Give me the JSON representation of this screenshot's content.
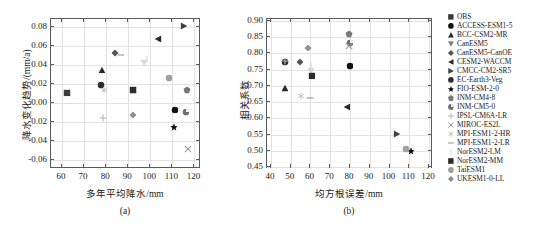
{
  "figure": {
    "panels": [
      {
        "id": "a",
        "caption": "(a)",
        "xlabel": "多年平均降水/mm",
        "ylabel": "降水变化趋势/(mm/a)",
        "xlim": [
          55,
          123
        ],
        "ylim": [
          -0.07,
          0.088
        ],
        "xticks": [
          60,
          70,
          80,
          90,
          100,
          110,
          120
        ],
        "xticklabels": [
          "60",
          "70",
          "80",
          "90",
          "100",
          "110",
          "120"
        ],
        "yticks": [
          -0.06,
          -0.04,
          -0.02,
          0.0,
          0.02,
          0.04,
          0.06,
          0.08
        ],
        "yticklabels": [
          "-0.06",
          "-0.04",
          "-0.02",
          "0.00",
          "0.02",
          "0.04",
          "0.06",
          "0.08"
        ]
      },
      {
        "id": "b",
        "caption": "(b)",
        "xlabel": "均方根误差/mm",
        "ylabel": "相关系数",
        "xlim": [
          38,
          122
        ],
        "ylim": [
          0.445,
          0.905
        ],
        "xticks": [
          40,
          50,
          60,
          70,
          80,
          90,
          100,
          110,
          120
        ],
        "xticklabels": [
          "40",
          "50",
          "60",
          "70",
          "80",
          "90",
          "100",
          "110",
          "120"
        ],
        "yticks": [
          0.45,
          0.5,
          0.55,
          0.6,
          0.65,
          0.7,
          0.75,
          0.8,
          0.85,
          0.9
        ],
        "yticklabels": [
          "0.45",
          "0.50",
          "0.55",
          "0.60",
          "0.65",
          "0.70",
          "0.75",
          "0.80",
          "0.85",
          "0.90"
        ]
      }
    ]
  },
  "legend": {
    "items": [
      {
        "label": "OBS",
        "marker": "square",
        "color": "#3c3c3c",
        "icon": "square-marker-icon"
      },
      {
        "label": "ACCESS-ESM1-5",
        "marker": "circle",
        "color": "#111111",
        "icon": "circle-marker-icon"
      },
      {
        "label": "BCC-CSM2-MR",
        "marker": "triangle-up",
        "color": "#2b2b2b",
        "icon": "triangle-up-marker-icon"
      },
      {
        "label": "CanESM5",
        "marker": "triangle-down",
        "color": "#808080",
        "icon": "triangle-down-marker-icon"
      },
      {
        "label": "CanESM5-CanOE",
        "marker": "diamond",
        "color": "#555555",
        "icon": "diamond-marker-icon"
      },
      {
        "label": "CESM2-WACCM",
        "marker": "triangle-left",
        "color": "#2b2b2b",
        "icon": "triangle-left-marker-icon"
      },
      {
        "label": "CMCC-CM2-SR5",
        "marker": "triangle-right",
        "color": "#404040",
        "icon": "triangle-right-marker-icon"
      },
      {
        "label": "EC-Earth3-Veg",
        "marker": "circle",
        "color": "#2f2f2f",
        "icon": "circle-marker-icon"
      },
      {
        "label": "FIO-ESM-2-0",
        "marker": "star",
        "color": "#111111",
        "icon": "star-marker-icon"
      },
      {
        "label": "INM-CM4-8",
        "marker": "pentagon",
        "color": "#777777",
        "icon": "pentagon-marker-icon"
      },
      {
        "label": "INM-CM5-0",
        "marker": "circle-split",
        "color": "#6e6e6e",
        "icon": "circle-split-marker-icon"
      },
      {
        "label": "IPSL-CM6A-LR",
        "marker": "plus",
        "color": "#b5b5b5",
        "icon": "plus-marker-icon"
      },
      {
        "label": "MIROC-ES2L",
        "marker": "cross",
        "color": "#9a9a9a",
        "icon": "cross-marker-icon"
      },
      {
        "label": "MPI-ESM1-2-HR",
        "marker": "asterisk",
        "color": "#c0c0c0",
        "icon": "asterisk-marker-icon"
      },
      {
        "label": "MPI-ESM1-2-LR",
        "marker": "hline",
        "color": "#8a8a8a",
        "icon": "horizontal-line-marker-icon"
      },
      {
        "label": "NorESM2-LM",
        "marker": "vline",
        "color": "#cccccc",
        "icon": "vertical-line-marker-icon"
      },
      {
        "label": "NorESM2-MM",
        "marker": "square",
        "color": "#2b2b2b",
        "icon": "square-marker-icon"
      },
      {
        "label": "TaiESM1",
        "marker": "circle",
        "color": "#a0a0a0",
        "icon": "circle-marker-icon"
      },
      {
        "label": "UKESM1-0-LL",
        "marker": "diamond",
        "color": "#909090",
        "icon": "diamond-marker-icon"
      }
    ]
  },
  "chart_data": [
    {
      "type": "scatter",
      "panel": "a",
      "title": "",
      "xlabel": "多年平均降水/mm",
      "ylabel": "降水变化趋势/(mm/a)",
      "xlim": [
        55,
        123
      ],
      "ylim": [
        -0.07,
        0.088
      ],
      "grid": true,
      "legend_position": "right-outside",
      "points": [
        {
          "name": "OBS",
          "x": 62.8,
          "y": 0.0093,
          "marker": "square",
          "color": "#3c3c3c"
        },
        {
          "name": "ACCESS-ESM1-5",
          "x": 111.5,
          "y": -0.0085,
          "marker": "circle",
          "color": "#111111"
        },
        {
          "name": "BCC-CSM2-MR",
          "x": 78.6,
          "y": 0.0337,
          "marker": "triangle-up",
          "color": "#2b2b2b"
        },
        {
          "name": "CanESM5",
          "x": 97.5,
          "y": 0.0407,
          "marker": "triangle-down",
          "color": "#d8d8d8"
        },
        {
          "name": "CanESM5-CanOE",
          "x": 84.6,
          "y": 0.0512,
          "marker": "diamond",
          "color": "#555555"
        },
        {
          "name": "CESM2-WACCM",
          "x": 104.0,
          "y": 0.0664,
          "marker": "triangle-left",
          "color": "#2b2b2b"
        },
        {
          "name": "CMCC-CM2-SR5",
          "x": 115.8,
          "y": 0.0792,
          "marker": "triangle-right",
          "color": "#404040"
        },
        {
          "name": "EC-Earth3-Veg",
          "x": 78.3,
          "y": 0.0175,
          "marker": "circle",
          "color": "#2f2f2f"
        },
        {
          "name": "FIO-ESM-2-0",
          "x": 111.0,
          "y": -0.0272,
          "marker": "star",
          "color": "#111111"
        },
        {
          "name": "INM-CM4-8",
          "x": 117.3,
          "y": 0.0122,
          "marker": "pentagon",
          "color": "#777777"
        },
        {
          "name": "INM-CM5-0",
          "x": 116.6,
          "y": -0.0113,
          "marker": "circle-split",
          "color": "#6e6e6e"
        },
        {
          "name": "IPSL-CM6A-LR",
          "x": 79.2,
          "y": -0.0175,
          "marker": "plus",
          "color": "#b5b5b5"
        },
        {
          "name": "MIROC-ES2L",
          "x": 117.5,
          "y": -0.0502,
          "marker": "cross",
          "color": "#9a9a9a"
        },
        {
          "name": "MPI-ESM1-2-HR",
          "x": 79.3,
          "y": 0.0123,
          "marker": "asterisk",
          "color": "#c0c0c0"
        },
        {
          "name": "MPI-ESM1-2-LR",
          "x": 87.0,
          "y": 0.0487,
          "marker": "hline",
          "color": "#8a8a8a"
        },
        {
          "name": "NorESM2-LM",
          "x": 99.0,
          "y": 0.0448,
          "marker": "vline",
          "color": "#d5d5d5"
        },
        {
          "name": "NorESM2-MM",
          "x": 92.6,
          "y": 0.0117,
          "marker": "square",
          "color": "#2b2b2b"
        },
        {
          "name": "TaiESM1",
          "x": 109.0,
          "y": 0.0243,
          "marker": "circle",
          "color": "#a0a0a0"
        },
        {
          "name": "UKESM1-0-LL",
          "x": 92.5,
          "y": -0.0138,
          "marker": "diamond",
          "color": "#909090"
        }
      ]
    },
    {
      "type": "scatter",
      "panel": "b",
      "title": "",
      "xlabel": "均方根误差/mm",
      "ylabel": "相关系数",
      "xlim": [
        38,
        122
      ],
      "ylim": [
        0.445,
        0.905
      ],
      "grid": true,
      "legend_position": "right-outside",
      "points": [
        {
          "name": "ACCESS-ESM1-5",
          "x": 80.3,
          "y": 0.757,
          "marker": "circle",
          "color": "#111111"
        },
        {
          "name": "BCC-CSM2-MR",
          "x": 47.4,
          "y": 0.69,
          "marker": "triangle-up",
          "color": "#2b2b2b"
        },
        {
          "name": "CanESM5",
          "x": 61.0,
          "y": 0.742,
          "marker": "triangle-down",
          "color": "#d8d8d8"
        },
        {
          "name": "CanESM5-CanOE",
          "x": 55.0,
          "y": 0.769,
          "marker": "diamond",
          "color": "#555555"
        },
        {
          "name": "CESM2-WACCM",
          "x": 78.8,
          "y": 0.633,
          "marker": "triangle-left",
          "color": "#2b2b2b"
        },
        {
          "name": "CMCC-CM2-SR5",
          "x": 104.5,
          "y": 0.549,
          "marker": "triangle-right",
          "color": "#404040"
        },
        {
          "name": "EC-Earth3-Veg",
          "x": 47.6,
          "y": 0.77,
          "marker": "circle",
          "color": "#2f2f2f"
        },
        {
          "name": "FIO-ESM-2-0",
          "x": 111.3,
          "y": 0.498,
          "marker": "star",
          "color": "#111111"
        },
        {
          "name": "INM-CM4-8",
          "x": 80.2,
          "y": 0.855,
          "marker": "pentagon",
          "color": "#777777"
        },
        {
          "name": "INM-CM5-0",
          "x": 80.3,
          "y": 0.828,
          "marker": "circle-split",
          "color": "#6e6e6e"
        },
        {
          "name": "IPSL-CM6A-LR",
          "x": 47.6,
          "y": 0.772,
          "marker": "plus",
          "color": "#b5b5b5"
        },
        {
          "name": "MIROC-ES2L",
          "x": 80.1,
          "y": 0.818,
          "marker": "cross",
          "color": "#9a9a9a"
        },
        {
          "name": "MPI-ESM1-2-HR",
          "x": 55.5,
          "y": 0.665,
          "marker": "asterisk",
          "color": "#c0c0c0"
        },
        {
          "name": "MPI-ESM1-2-LR",
          "x": 60.3,
          "y": 0.661,
          "marker": "hline",
          "color": "#8a8a8a"
        },
        {
          "name": "NorESM2-LM",
          "x": 60.8,
          "y": 0.757,
          "marker": "vline",
          "color": "#d5d5d5"
        },
        {
          "name": "NorESM2-MM",
          "x": 61.2,
          "y": 0.728,
          "marker": "square",
          "color": "#2b2b2b"
        },
        {
          "name": "TaiESM1",
          "x": 108.8,
          "y": 0.503,
          "marker": "circle",
          "color": "#a0a0a0"
        },
        {
          "name": "UKESM1-0-LL",
          "x": 59.5,
          "y": 0.814,
          "marker": "diamond",
          "color": "#909090"
        }
      ]
    }
  ]
}
